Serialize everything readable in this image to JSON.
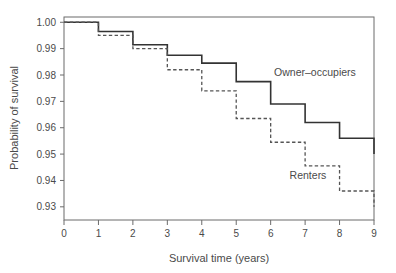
{
  "chart_data": {
    "type": "line",
    "subtype": "kaplan-meier-step",
    "title": "",
    "xlabel": "Survival time (years)",
    "ylabel": "Probability of survival",
    "xlim": [
      0,
      9
    ],
    "ylim": [
      0.925,
      1.002
    ],
    "grid": false,
    "legend_position": "inline-annotation",
    "xticks": [
      0,
      1,
      2,
      3,
      4,
      5,
      6,
      7,
      8,
      9
    ],
    "xtick_labels": [
      "0",
      "1",
      "2",
      "3",
      "4",
      "5",
      "6",
      "7",
      "8",
      "9"
    ],
    "yticks": [
      0.93,
      0.94,
      0.95,
      0.96,
      0.97,
      0.98,
      0.99,
      1.0
    ],
    "ytick_labels": [
      "0.93",
      "0.94",
      "0.95",
      "0.96",
      "0.97",
      "0.98",
      "0.99",
      "1.00"
    ],
    "x": [
      0,
      1,
      2,
      3,
      4,
      5,
      6,
      7,
      8,
      9
    ],
    "series": [
      {
        "name": "Owner-occupiers",
        "label": "Owner–occupiers",
        "style": "solid",
        "color": "#333333",
        "values": [
          1.0,
          0.9965,
          0.9915,
          0.9875,
          0.9845,
          0.9775,
          0.969,
          0.962,
          0.956,
          0.95
        ],
        "label_x": 6.1,
        "label_y": 0.9795
      },
      {
        "name": "Renters",
        "label": "Renters",
        "style": "dashed",
        "color": "#555555",
        "values": [
          1.0,
          0.995,
          0.99,
          0.982,
          0.974,
          0.9635,
          0.9545,
          0.9455,
          0.936,
          0.93
        ],
        "label_x": 6.55,
        "label_y": 0.9405
      }
    ]
  },
  "annotations": {
    "owner_occupiers_label": "Owner–occupiers",
    "renters_label": "Renters"
  }
}
